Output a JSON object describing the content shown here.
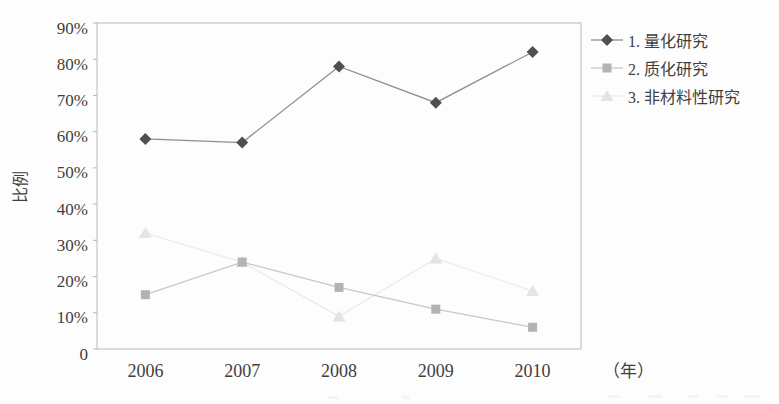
{
  "figure": {
    "background": "#fdfdfd",
    "text_color": "#3f3f3f",
    "plot_border_color": "#c5c5c5",
    "tick_color": "#b5b5b5"
  },
  "chart_data": {
    "type": "line",
    "title": "",
    "categories": [
      "2006",
      "2007",
      "2008",
      "2009",
      "2010"
    ],
    "series": [
      {
        "name": "1. 量化研究",
        "values": [
          58,
          57,
          78,
          68,
          82
        ],
        "marker": "diamond",
        "marker_color": "#4f4f4f",
        "line_color": "#8f8f8f"
      },
      {
        "name": "2. 质化研究",
        "values": [
          15,
          24,
          17,
          11,
          6
        ],
        "marker": "square",
        "marker_color": "#b3b3b3",
        "line_color": "#c7c7c7"
      },
      {
        "name": "3. 非材料性研究",
        "values": [
          32,
          24,
          9,
          25,
          16
        ],
        "marker": "triangle",
        "marker_color": "#e4e4e4",
        "line_color": "#ebebeb"
      }
    ],
    "xlabel": "（年）",
    "ylabel": "比例",
    "ylim": [
      0,
      90
    ],
    "y_ticks": [
      {
        "value": 90,
        "label": "90%"
      },
      {
        "value": 80,
        "label": "80%"
      },
      {
        "value": 70,
        "label": "70%"
      },
      {
        "value": 60,
        "label": "60%"
      },
      {
        "value": 50,
        "label": "50%"
      },
      {
        "value": 40,
        "label": "40%"
      },
      {
        "value": 30,
        "label": "30%"
      },
      {
        "value": 20,
        "label": "20%"
      },
      {
        "value": 10,
        "label": "10%"
      },
      {
        "value": 0,
        "label": "0"
      }
    ],
    "grid": false,
    "legend_position": "right"
  }
}
